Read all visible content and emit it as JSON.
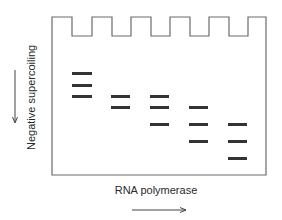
{
  "figure": {
    "y_axis_label": "Negative supercoiling",
    "y_axis_arrow": "down-arrow",
    "x_axis_label": "RNA polymerase",
    "x_axis_arrow": "right-arrow",
    "colors": {
      "outline": "#6b6b6b",
      "band": "#333333",
      "text": "#2a2a2a"
    },
    "gel": {
      "lanes": 5,
      "wells": 5,
      "bands": [
        {
          "lane": 1,
          "positions": [
            73,
            85,
            96
          ]
        },
        {
          "lane": 2,
          "positions": [
            96,
            107
          ]
        },
        {
          "lane": 3,
          "positions": [
            96,
            107,
            124
          ]
        },
        {
          "lane": 4,
          "positions": [
            107,
            124,
            141
          ]
        },
        {
          "lane": 5,
          "positions": [
            124,
            141,
            158
          ]
        }
      ]
    }
  }
}
